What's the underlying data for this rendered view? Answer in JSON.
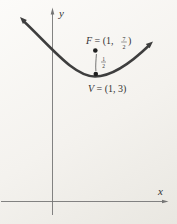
{
  "figure": {
    "background": "#f4f2ee",
    "curve_color": "#3e3e3e",
    "axis_color": "#757575",
    "text_color": "#333333",
    "point_color": "#1f1f1f"
  },
  "labels": {
    "y_axis": "y",
    "x_axis": "x",
    "focus": {
      "letter": "F",
      "mid": " = (1, ",
      "frac_num": "7",
      "frac_den": "2",
      "close": ")"
    },
    "vertex": {
      "letter": "V",
      "rest": " = (1, 3)"
    },
    "distance": {
      "frac_num": "1",
      "frac_den": "2"
    }
  }
}
